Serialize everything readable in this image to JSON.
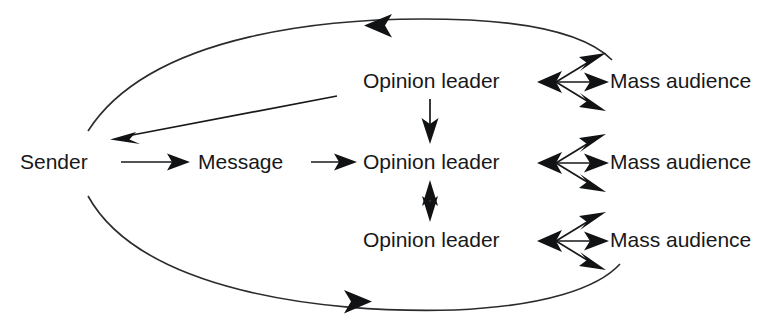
{
  "diagram": {
    "background_color": "#ffffff",
    "stroke_color": "#17181a",
    "arc_color": "#2b2b2d",
    "nodes": {
      "sender": "Sender",
      "message": "Message",
      "opinion_leader_top": "Opinion leader",
      "opinion_leader_middle": "Opinion leader",
      "opinion_leader_bottom": "Opinion leader",
      "mass_audience_top": "Mass audience",
      "mass_audience_middle": "Mass audience",
      "mass_audience_bottom": "Mass audience"
    },
    "connections": [
      {
        "name": "sender-to-message",
        "from": "Sender",
        "to": "Message",
        "style": "straight",
        "heads": "single"
      },
      {
        "name": "message-to-opinion-leader",
        "from": "Message",
        "to": "Opinion leader",
        "style": "straight",
        "heads": "single"
      },
      {
        "name": "opinion-leader-top-to-sender",
        "from": "Opinion leader",
        "to": "Sender",
        "style": "diagonal",
        "heads": "single"
      },
      {
        "name": "opinion-leader-top-to-middle",
        "from": "Opinion leader",
        "to": "Opinion leader",
        "style": "vertical",
        "heads": "single"
      },
      {
        "name": "opinion-leader-middle-to-bottom",
        "from": "Opinion leader",
        "to": "Opinion leader",
        "style": "vertical",
        "heads": "double"
      },
      {
        "name": "fan-top",
        "from": "Opinion leader",
        "to": "Mass audience",
        "style": "fan",
        "heads": "bidirectional"
      },
      {
        "name": "fan-middle",
        "from": "Opinion leader",
        "to": "Mass audience",
        "style": "fan",
        "heads": "bidirectional"
      },
      {
        "name": "fan-bottom",
        "from": "Opinion leader",
        "to": "Mass audience",
        "style": "fan",
        "heads": "bidirectional"
      },
      {
        "name": "feedback-arc-top",
        "from": "Mass audience",
        "to": "Sender",
        "style": "arc",
        "heads": "single"
      },
      {
        "name": "feedback-arc-bottom",
        "from": "Sender",
        "to": "Mass audience",
        "style": "arc",
        "heads": "single"
      }
    ]
  }
}
